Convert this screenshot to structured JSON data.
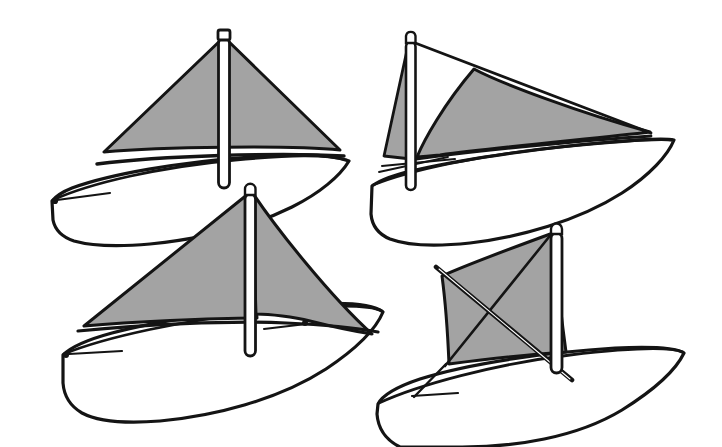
{
  "figure": {
    "type": "line-art-illustration",
    "background_color": "#ffffff",
    "ink_color": "#141414",
    "sail_fill_color": "#a3a3a3",
    "hull_fill_color": "#ffffff",
    "mast_fill_color": "#ffffff",
    "width": 722,
    "height": 447,
    "boat_count": 4
  },
  "boats": [
    {
      "id": "boat-top-left",
      "label": "Top left sailboat",
      "position": "top-left",
      "sail_count": 1,
      "sail_rig": "single triangular sail",
      "mast_top": [
        224,
        33
      ],
      "mast_bottom": [
        228,
        187
      ],
      "hull_bow": [
        52,
        201
      ],
      "hull_stern": [
        349,
        160
      ],
      "sails": [
        {
          "name": "mainsail",
          "shape": "triangle",
          "fill": "#a3a3a3",
          "points": "224,37 104,152 340,150"
        }
      ],
      "spars": [
        {
          "name": "boom",
          "points": "97,163 222,152 343,153"
        }
      ]
    },
    {
      "id": "boat-top-right",
      "label": "Top right sailboat",
      "position": "top-right",
      "sail_count": 2,
      "sail_rig": "lateen rig with jib",
      "mast_top": [
        411,
        38
      ],
      "mast_bottom": [
        414,
        190
      ],
      "hull_bow": [
        372,
        185
      ],
      "hull_stern": [
        674,
        139
      ],
      "sails": [
        {
          "name": "jib-sail",
          "shape": "triangle",
          "fill": "#a3a3a3",
          "points": "409,40 385,155 410,158"
        },
        {
          "name": "lateen-mainsail",
          "shape": "curved-triangle",
          "fill": "#a3a3a3",
          "points": "472,68 652,132 418,157"
        }
      ],
      "spars": [
        {
          "name": "yard",
          "points": "410,40 650,133"
        },
        {
          "name": "boom",
          "points": "410,160 651,136"
        }
      ]
    },
    {
      "id": "boat-bottom-left",
      "label": "Bottom left sailboat",
      "position": "bottom-left",
      "sail_count": 2,
      "sail_rig": "mainsail and mizzen",
      "mast_top": [
        249,
        189
      ],
      "mast_bottom": [
        255,
        354
      ],
      "hull_bow": [
        63,
        355
      ],
      "hull_stern": [
        383,
        323
      ],
      "sails": [
        {
          "name": "mainsail",
          "shape": "triangle",
          "fill": "#a3a3a3",
          "points": "248,194 86,325 258,318"
        },
        {
          "name": "mizzen-sail",
          "shape": "triangle",
          "fill": "#a3a3a3",
          "points": "252,192 371,334 310,320"
        }
      ],
      "spars": [
        {
          "name": "boom",
          "points": "80,330 250,320 378,328"
        }
      ]
    },
    {
      "id": "boat-bottom-right",
      "label": "Bottom right sailboat",
      "position": "bottom-right",
      "sail_count": 1,
      "sail_rig": "square lug sail with crossed spars",
      "mast_top": [
        556,
        231
      ],
      "mast_bottom": [
        560,
        370
      ],
      "hull_bow": [
        378,
        404
      ],
      "hull_stern": [
        683,
        352
      ],
      "sails": [
        {
          "name": "lug-sail",
          "shape": "quadrilateral",
          "fill": "#a3a3a3",
          "points": "553,233 441,276 448,364 565,352"
        }
      ],
      "spars": [
        {
          "name": "upper-spar-diagonal",
          "points": "553,232 444,365"
        },
        {
          "name": "lower-spar-diagonal",
          "points": "437,268 571,379"
        }
      ]
    }
  ]
}
